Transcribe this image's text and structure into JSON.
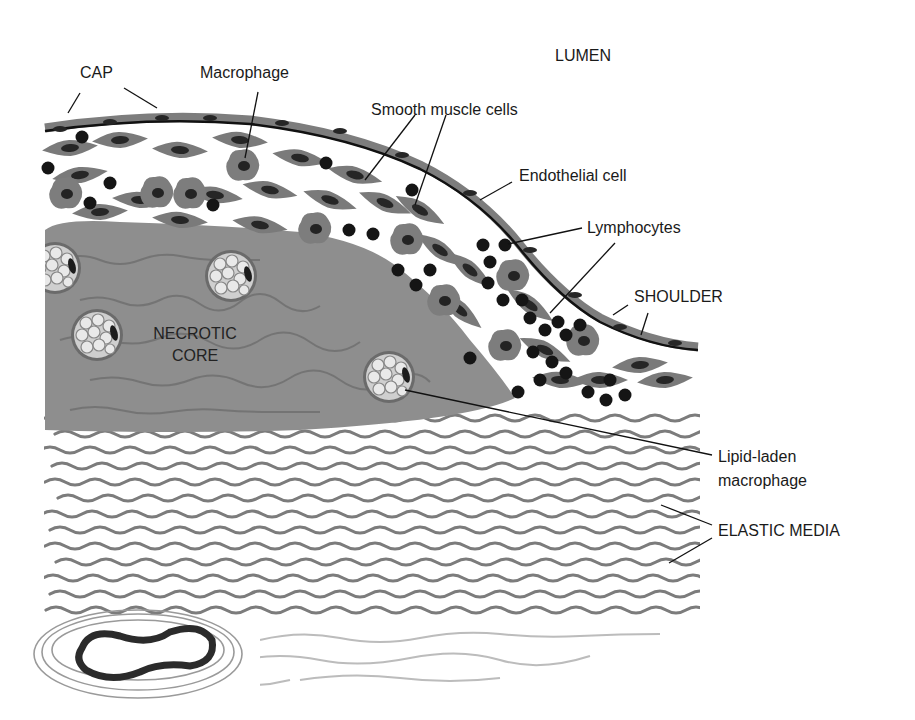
{
  "diagram": {
    "labels": {
      "cap": "CAP",
      "macrophage": "Macrophage",
      "lumen": "LUMEN",
      "smooth_muscle": "Smooth muscle cells",
      "endothelial": "Endothelial cell",
      "lymphocytes": "Lymphocytes",
      "shoulder": "SHOULDER",
      "necrotic_core_line1": "NECROTIC",
      "necrotic_core_line2": "CORE",
      "lipid_laden_line1": "Lipid-laden",
      "lipid_laden_line2": "macrophage",
      "elastic_media": "ELASTIC MEDIA"
    },
    "colors": {
      "background": "#ffffff",
      "necrotic_core": "#8e8e8e",
      "cell_body": "#7a7a7a",
      "nucleus": "#1e1e1e",
      "lymphocyte": "#151515",
      "elastic_fiber": "#6e6e6e",
      "leader_line": "#111111"
    }
  }
}
